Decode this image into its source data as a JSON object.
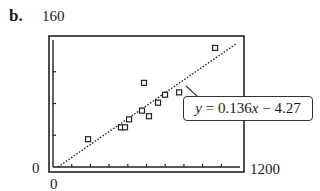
{
  "panel_label": "b.",
  "chart_data": {
    "type": "scatter",
    "title": "",
    "xlabel": "",
    "ylabel": "",
    "xlim": [
      0,
      1200
    ],
    "ylim": [
      0,
      160
    ],
    "x_tick_labels": {
      "min": "0",
      "max": "1200"
    },
    "y_tick_labels": {
      "min": "0",
      "max": "160"
    },
    "x_tick_count": 10,
    "y_tick_count": 4,
    "grid": false,
    "series": [
      {
        "name": "data",
        "marker": "square",
        "points": [
          [
            225,
            35
          ],
          [
            436,
            50
          ],
          [
            462,
            50
          ],
          [
            488,
            60
          ],
          [
            571,
            71
          ],
          [
            584,
            106
          ],
          [
            616,
            64
          ],
          [
            674,
            81
          ],
          [
            719,
            91
          ],
          [
            809,
            94
          ],
          [
            1040,
            150
          ]
        ]
      }
    ],
    "regression": {
      "slope": 0.136,
      "intercept": -4.27,
      "equation_label": "y = 0.136x − 4.27",
      "style": "dotted"
    }
  },
  "annotation": {
    "prefix_var": "y",
    "mid": " = 0.136",
    "x_var": "x",
    "suffix": " − 4.27"
  }
}
